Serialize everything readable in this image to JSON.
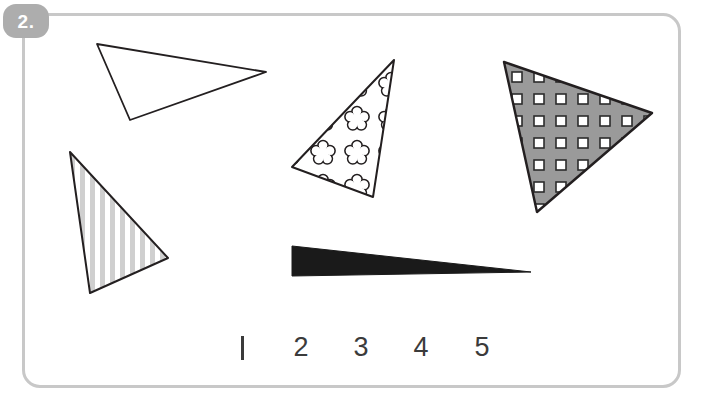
{
  "worksheet": {
    "exercise_number": "2.",
    "border_color": "#c8c8c8",
    "badge_color": "#adadad",
    "background": "#ffffff",
    "width": 703,
    "height": 404
  },
  "figures": {
    "caption": "five triangles with different fills",
    "items": [
      {
        "id": "triangle-1",
        "shape": "triangle",
        "fill_name": "white-unfilled",
        "fill_color": "#ffffff",
        "stroke_color": "#231f20",
        "points": "97,44 266,72 130,120",
        "number": "1"
      },
      {
        "id": "triangle-2",
        "shape": "triangle",
        "fill_name": "vertical-stripes",
        "fill_color": "#c9c9c9",
        "stroke_color": "#231f20",
        "points": "70,152 168,258 90,293",
        "number": "2"
      },
      {
        "id": "triangle-3",
        "shape": "triangle",
        "fill_name": "flower-pattern",
        "fill_color": "#ffffff",
        "stroke_color": "#231f20",
        "points": "394,60 292,167 373,197",
        "number": "3"
      },
      {
        "id": "triangle-4",
        "shape": "triangle",
        "fill_name": "gray-with-white-squares",
        "fill_color": "#9a9a9a",
        "stroke_color": "#231f20",
        "points": "504,62 652,113 537,212",
        "number": "4"
      },
      {
        "id": "triangle-5",
        "shape": "triangle",
        "fill_name": "solid-black-sliver",
        "fill_color": "#1a1a1a",
        "stroke_color": "#1a1a1a",
        "points": "292,246 531,272 292,276",
        "number": "5"
      }
    ]
  },
  "answer_row": {
    "labels": [
      {
        "text": "1",
        "x": 240,
        "y": 336
      },
      {
        "text": "2",
        "x": 300,
        "y": 336
      },
      {
        "text": "3",
        "x": 360,
        "y": 336
      },
      {
        "text": "4",
        "x": 420,
        "y": 336
      },
      {
        "text": "5",
        "x": 481,
        "y": 336
      }
    ],
    "text_color": "#3b3b3b"
  }
}
